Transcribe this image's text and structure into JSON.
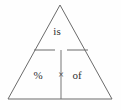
{
  "diagram": {
    "name": "percentage-triangle",
    "type": "formula-triangle",
    "background_color": "#fefefe",
    "line_color": "#6b6b6b",
    "text_color": "#2e2e2e",
    "shape": {
      "apex": [
        60,
        5
      ],
      "bottom_left": [
        8,
        99
      ],
      "bottom_right": [
        112,
        99
      ]
    },
    "divider": {
      "y": 50,
      "x_start": 34,
      "x_end": 88,
      "gap_left": 55,
      "gap_right": 67
    },
    "stem": {
      "x": 61,
      "y_top": 50,
      "y_bottom": 99
    },
    "top_cell": {
      "label": "is",
      "x": 57,
      "y": 32
    },
    "bottom_cells": [
      {
        "label": "%",
        "x": 38,
        "y": 76
      },
      {
        "label": "×",
        "x": 61,
        "y": 76
      },
      {
        "label": "of",
        "x": 77,
        "y": 76
      }
    ]
  }
}
